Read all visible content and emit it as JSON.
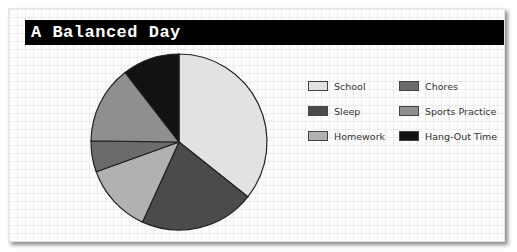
{
  "title": "A Balanced Day",
  "chart_data": {
    "type": "pie",
    "title": "A Balanced Day",
    "start_angle_deg": 0,
    "direction": "clockwise",
    "categories": [
      "School",
      "Sleep",
      "Homework",
      "Chores",
      "Sports Practice",
      "Hang-Out Time"
    ],
    "values": [
      35.7,
      21.1,
      12.7,
      5.7,
      14.3,
      10.5
    ],
    "unit": "percent (estimated from slice angles)",
    "colors": [
      "#e2e2e2",
      "#4b4b4b",
      "#b1b1b1",
      "#6b6b6b",
      "#8f8f8f",
      "#121212"
    ],
    "legend_position": "right",
    "grid": true
  },
  "legend": {
    "items": [
      {
        "label": "School",
        "color": "#e2e2e2"
      },
      {
        "label": "Sleep",
        "color": "#4b4b4b"
      },
      {
        "label": "Homework",
        "color": "#b1b1b1"
      },
      {
        "label": "Chores",
        "color": "#6b6b6b"
      },
      {
        "label": "Sports Practice",
        "color": "#8f8f8f"
      },
      {
        "label": "Hang-Out Time",
        "color": "#121212"
      }
    ]
  }
}
